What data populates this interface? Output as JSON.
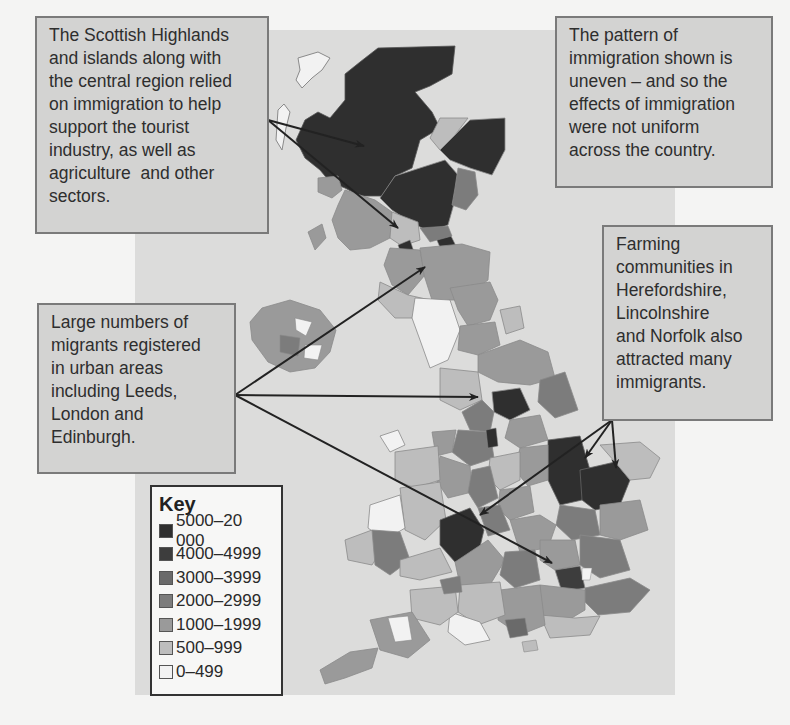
{
  "figure": {
    "type": "choropleth-map"
  },
  "callouts": [
    {
      "id": "scottish-highlands",
      "lines": [
        "The Scottish Highlands",
        "and islands along with",
        "the central region relied",
        "on immigration to help",
        "support the tourist",
        "industry, as well as",
        "agriculture  and other",
        "sectors."
      ]
    },
    {
      "id": "pattern-uneven",
      "lines": [
        "The pattern of",
        "immigration shown is",
        "uneven – and so the",
        "effects of immigration",
        "were not uniform",
        "across the country."
      ]
    },
    {
      "id": "farming-communities",
      "lines": [
        "Farming",
        "communities in",
        "Herefordshire,",
        "Lincolnshire",
        "and Norfolk also",
        "attracted many",
        "immigrants."
      ]
    },
    {
      "id": "urban-areas",
      "lines": [
        "Large numbers of",
        "migrants registered",
        "in urban areas",
        "including Leeds,",
        "London and",
        "Edinburgh."
      ]
    }
  ],
  "key": {
    "title": "Key",
    "items": [
      {
        "label": "5000–20 000",
        "color": "#2f2f2f"
      },
      {
        "label": "4000–4999",
        "color": "#3d3d3d"
      },
      {
        "label": "3000–3999",
        "color": "#6a6a6a"
      },
      {
        "label": "2000–2999",
        "color": "#7c7c7c"
      },
      {
        "label": "1000–1999",
        "color": "#9a9a9a"
      },
      {
        "label": "500–999",
        "color": "#bdbdbd"
      },
      {
        "label": "0–499",
        "color": "#f2f2f2"
      }
    ]
  },
  "colors": {
    "page_background": "#f4f4f3",
    "map_background": "#dcdcdb",
    "callout_fill": "#d3d3d2",
    "callout_border": "#7a7a7a",
    "arrow": "#222222",
    "region_border": "#8a8a8a"
  }
}
